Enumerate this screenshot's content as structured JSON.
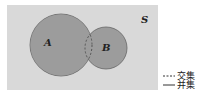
{
  "diagram": {
    "type": "venn",
    "universe_label": "S",
    "sets": [
      {
        "id": "A",
        "label": "A"
      },
      {
        "id": "B",
        "label": "B"
      }
    ],
    "legend": [
      {
        "style": "dashed",
        "label": "交集"
      },
      {
        "style": "solid",
        "label": "并集"
      }
    ],
    "colors": {
      "universe": "#d9d9d9",
      "circle_fill": "#9a9a9a",
      "stroke": "#555555"
    }
  }
}
